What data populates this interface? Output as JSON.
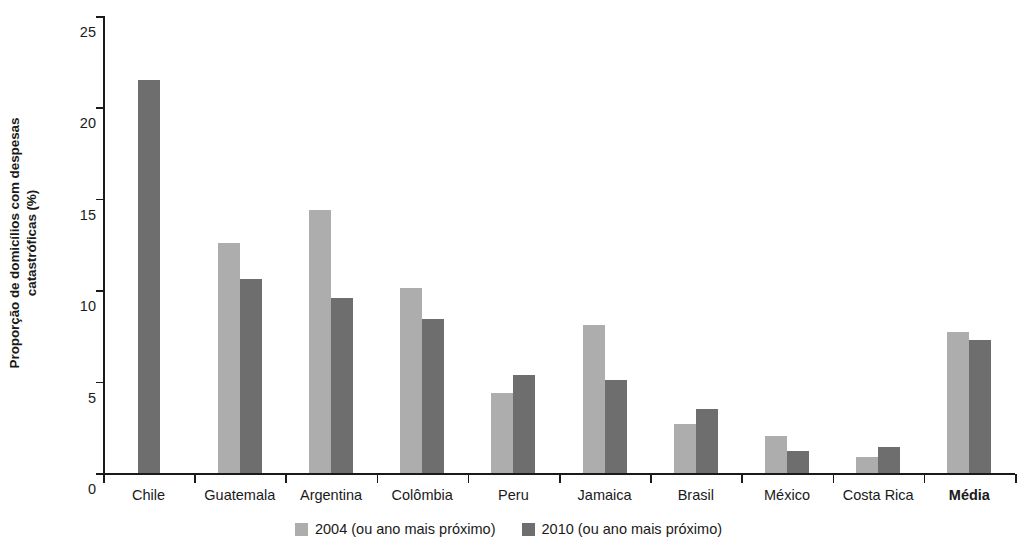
{
  "chart_data": {
    "type": "bar",
    "title": "",
    "subtitle": "",
    "xlabel": "",
    "ylabel_line1": "Proporção de domicílios com despesas",
    "ylabel_line2": "catastróficas (%)",
    "ylim": [
      0,
      25
    ],
    "yticks": [
      0,
      5,
      10,
      15,
      20,
      25
    ],
    "ytick_labels": [
      "0",
      "5",
      "10",
      "15",
      "20",
      "25"
    ],
    "grid": false,
    "legend_position": "bottom-center",
    "categories": [
      "Chile",
      "Guatemala",
      "Argentina",
      "Colômbia",
      "Peru",
      "Jamaica",
      "Brasil",
      "México",
      "Costa Rica",
      "Média"
    ],
    "categories_emphasis": [
      false,
      false,
      false,
      false,
      false,
      false,
      false,
      false,
      false,
      true
    ],
    "series": [
      {
        "name": "2004 (ou ano mais próximo)",
        "color": "#adadad",
        "values": [
          null,
          12.6,
          14.4,
          10.1,
          4.4,
          8.1,
          2.7,
          2.0,
          0.9,
          7.7
        ]
      },
      {
        "name": "2010 (ou ano mais próximo)",
        "color": "#6e6e6e",
        "values": [
          21.5,
          10.6,
          9.6,
          8.4,
          5.35,
          5.1,
          3.5,
          1.2,
          1.4,
          7.3
        ]
      }
    ]
  },
  "legend": {
    "items": [
      {
        "label": "2004 (ou ano mais próximo)",
        "color": "#adadad"
      },
      {
        "label": "2010 (ou ano mais próximo)",
        "color": "#6e6e6e"
      }
    ]
  },
  "colors": {
    "series_2004": "#adadad",
    "series_2010": "#6e6e6e",
    "axis": "#1a1a1a",
    "background": "#ffffff"
  }
}
